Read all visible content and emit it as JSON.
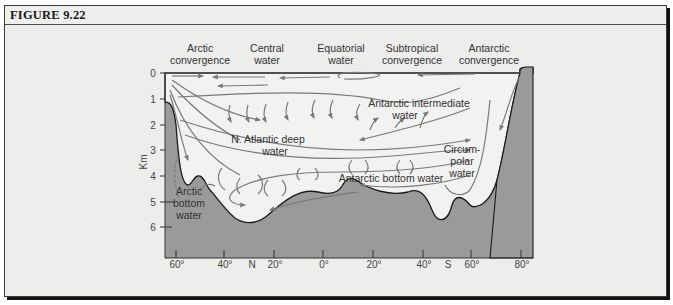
{
  "figure": {
    "title": "FIGURE 9.22"
  },
  "diagram": {
    "type": "ocean cross-section",
    "y_axis": {
      "label": "Km",
      "ticks": [
        "0",
        "1",
        "2",
        "3",
        "4",
        "5",
        "6"
      ]
    },
    "x_axis": {
      "ticks": [
        "60°",
        "40°",
        "N",
        "20°",
        "0°",
        "20°",
        "40°",
        "S",
        "60°",
        "80°"
      ]
    },
    "surface_labels": [
      {
        "line1": "Arctic",
        "line2": "convergence"
      },
      {
        "line1": "Central",
        "line2": "water"
      },
      {
        "line1": "Equatorial",
        "line2": "water"
      },
      {
        "line1": "Subtropical",
        "line2": "convergence"
      },
      {
        "line1": "Antarctic",
        "line2": "convergence"
      }
    ],
    "water_mass_labels": {
      "antarctic_intermediate": {
        "line1": "Antarctic intermediate",
        "line2": "water"
      },
      "n_atlantic_deep": {
        "line1": "N. Atlantic deep",
        "line2": "water"
      },
      "circumpolar": {
        "line1": "Circum-",
        "line2": "polar",
        "line3": "water"
      },
      "antarctic_bottom": {
        "line1": "Antarctic bottom water"
      },
      "arctic_bottom": {
        "line1": "Arctic",
        "line2": "bottom",
        "line3": "water"
      }
    },
    "colors": {
      "seafloor": "#9a9a9a",
      "water": "#f2f2f0",
      "arrows": "#7a7a7a",
      "background": "#ededec"
    }
  }
}
